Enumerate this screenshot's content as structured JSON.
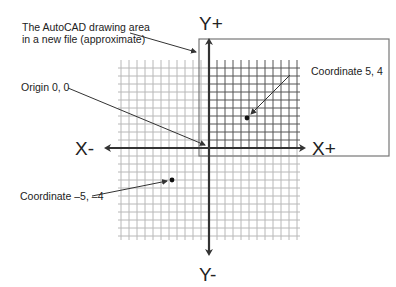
{
  "diagram": {
    "axes": {
      "x_positive": "X+",
      "x_negative": "X-",
      "y_positive": "Y+",
      "y_negative": "Y-"
    },
    "callouts": {
      "drawing_area_line1": "The AutoCAD drawing area",
      "drawing_area_line2": "in a new file (approximate)",
      "origin": "Origin 0, 0",
      "coord_positive": "Coordinate 5, 4",
      "coord_negative": "Coordinate –5, –4"
    },
    "points": [
      {
        "label": "Coordinate 5, 4",
        "x": 5,
        "y": 4
      },
      {
        "label": "Coordinate -5, -4",
        "x": -5,
        "y": -4
      },
      {
        "label": "Origin 0, 0",
        "x": 0,
        "y": 0
      }
    ],
    "colors": {
      "grid_light": "#b8b8b8",
      "grid_dark": "#555555",
      "axis": "#333333",
      "rect": "#777777",
      "text": "#222222"
    }
  }
}
